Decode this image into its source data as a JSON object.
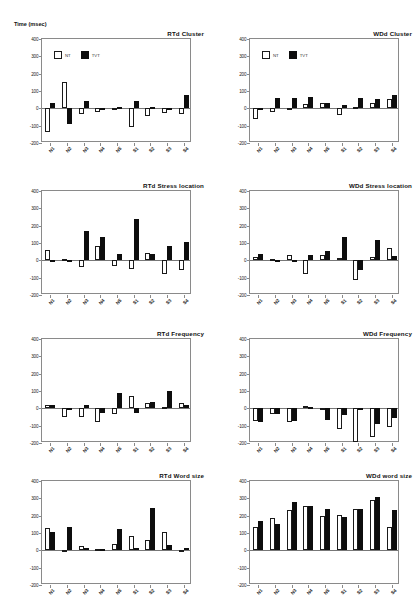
{
  "figure": {
    "width": 417,
    "height": 604,
    "ylabel": "Time (msec)",
    "legend": [
      {
        "key": "open",
        "label": "NT"
      },
      {
        "key": "filled",
        "label": "TVT"
      }
    ]
  },
  "chart_data": [
    {
      "id": "rtd-cluster",
      "type": "bar",
      "title": "RTd Cluster",
      "ylabel": "Time (msec)",
      "xlabel": "",
      "ylim": [
        -200,
        400
      ],
      "yticks": [
        400,
        300,
        200,
        100,
        0,
        -100,
        -200
      ],
      "grid": false,
      "legend_position": "top-left",
      "categories": [
        "N1",
        "N2",
        "N3",
        "N4",
        "N5",
        "S1",
        "S2",
        "S3",
        "S4"
      ],
      "series": [
        {
          "name": "NT",
          "values": [
            -135,
            150,
            -35,
            -20,
            -8,
            -108,
            -42,
            -25,
            -30
          ]
        },
        {
          "name": "TVT",
          "values": [
            28,
            -90,
            45,
            -12,
            10,
            42,
            8,
            -10,
            78
          ]
        }
      ]
    },
    {
      "id": "wdd-cluster",
      "type": "bar",
      "title": "WDd Cluster",
      "ylabel": "Time (msec)",
      "xlabel": "",
      "ylim": [
        -200,
        400
      ],
      "yticks": [
        400,
        300,
        200,
        100,
        0,
        -100,
        -200
      ],
      "grid": false,
      "legend_position": "top-left",
      "categories": [
        "N1",
        "N2",
        "N3",
        "N4",
        "N5",
        "S1",
        "S2",
        "S3",
        "S4"
      ],
      "series": [
        {
          "name": "NT",
          "values": [
            -62,
            -22,
            -8,
            25,
            30,
            -38,
            8,
            30,
            55
          ]
        },
        {
          "name": "TVT",
          "values": [
            -5,
            60,
            62,
            68,
            28,
            22,
            62,
            52,
            78
          ]
        }
      ]
    },
    {
      "id": "rtd-stress-location",
      "type": "bar",
      "title": "RTd Stress location",
      "ylabel": "Time (msec)",
      "xlabel": "",
      "ylim": [
        -200,
        400
      ],
      "yticks": [
        400,
        300,
        200,
        100,
        0,
        -100,
        -200
      ],
      "grid": false,
      "legend_position": "none",
      "categories": [
        "N1",
        "N2",
        "N3",
        "N4",
        "N5",
        "S1",
        "S2",
        "S3",
        "S4"
      ],
      "series": [
        {
          "name": "NT",
          "values": [
            62,
            5,
            -38,
            85,
            -32,
            -48,
            40,
            -78,
            -58
          ]
        },
        {
          "name": "TVT",
          "values": [
            0,
            0,
            168,
            135,
            35,
            238,
            38,
            85,
            108
          ]
        }
      ]
    },
    {
      "id": "wdd-stress-location",
      "type": "bar",
      "title": "WDd Stress location",
      "ylabel": "Time (msec)",
      "xlabel": "",
      "ylim": [
        -200,
        400
      ],
      "yticks": [
        400,
        300,
        200,
        100,
        0,
        -100,
        -200
      ],
      "grid": false,
      "legend_position": "none",
      "categories": [
        "N1",
        "N2",
        "N3",
        "N4",
        "N5",
        "S1",
        "S2",
        "S3",
        "S4"
      ],
      "series": [
        {
          "name": "NT",
          "values": [
            18,
            5,
            30,
            -78,
            28,
            15,
            -115,
            22,
            70
          ]
        },
        {
          "name": "TVT",
          "values": [
            38,
            0,
            -8,
            28,
            52,
            132,
            -55,
            115,
            25
          ]
        }
      ]
    },
    {
      "id": "rtd-frequency",
      "type": "bar",
      "title": "RTd Frequency",
      "ylabel": "Time (msec)",
      "xlabel": "",
      "ylim": [
        -200,
        400
      ],
      "yticks": [
        400,
        300,
        200,
        100,
        0,
        -100,
        -200
      ],
      "grid": false,
      "legend_position": "none",
      "categories": [
        "N1",
        "N2",
        "N3",
        "N4",
        "N5",
        "S1",
        "S2",
        "S3",
        "S4"
      ],
      "series": [
        {
          "name": "NT",
          "values": [
            22,
            -52,
            -48,
            -78,
            -30,
            72,
            32,
            5,
            28
          ]
        },
        {
          "name": "TVT",
          "values": [
            22,
            -12,
            22,
            -28,
            88,
            -28,
            38,
            98,
            18
          ]
        }
      ]
    },
    {
      "id": "wdd-frequency",
      "type": "bar",
      "title": "WDd Frequency",
      "ylabel": "Time (msec)",
      "xlabel": "",
      "ylim": [
        -200,
        400
      ],
      "yticks": [
        400,
        300,
        200,
        100,
        0,
        -100,
        -200
      ],
      "grid": false,
      "legend_position": "none",
      "categories": [
        "N1",
        "N2",
        "N3",
        "N4",
        "N5",
        "S1",
        "S2",
        "S3",
        "S4"
      ],
      "series": [
        {
          "name": "NT",
          "values": [
            -72,
            -30,
            -78,
            15,
            -5,
            -118,
            -195,
            -165,
            -108
          ]
        },
        {
          "name": "TVT",
          "values": [
            -78,
            -32,
            -72,
            8,
            -65,
            -40,
            -8,
            -88,
            -58
          ]
        }
      ]
    },
    {
      "id": "rtd-word-size",
      "type": "bar",
      "title": "RTd Word size",
      "ylabel": "Time (msec)",
      "xlabel": "",
      "ylim": [
        -200,
        400
      ],
      "yticks": [
        400,
        300,
        200,
        100,
        0,
        -100,
        -200
      ],
      "grid": false,
      "legend_position": "none",
      "categories": [
        "N1",
        "N2",
        "N3",
        "N4",
        "N5",
        "S1",
        "S2",
        "S3",
        "S4"
      ],
      "series": [
        {
          "name": "NT",
          "values": [
            128,
            -8,
            25,
            8,
            38,
            82,
            62,
            108,
            2
          ]
        },
        {
          "name": "TVT",
          "values": [
            108,
            135,
            15,
            8,
            122,
            12,
            245,
            28,
            15
          ]
        }
      ]
    },
    {
      "id": "wdd-word-size",
      "type": "bar",
      "title": "WDd word size",
      "ylabel": "Time (msec)",
      "xlabel": "",
      "ylim": [
        -200,
        400
      ],
      "yticks": [
        400,
        300,
        200,
        100,
        0,
        -100,
        -200
      ],
      "grid": false,
      "legend_position": "none",
      "categories": [
        "N1",
        "N2",
        "N3",
        "N4",
        "N5",
        "S1",
        "S2",
        "S3",
        "S4"
      ],
      "series": [
        {
          "name": "NT",
          "values": [
            132,
            188,
            232,
            258,
            200,
            202,
            240,
            292,
            132
          ]
        },
        {
          "name": "TVT",
          "values": [
            172,
            150,
            278,
            258,
            240,
            190,
            238,
            310,
            232
          ]
        }
      ]
    }
  ],
  "panel_layout": [
    {
      "id": "rtd-cluster",
      "left": 8,
      "top": 30
    },
    {
      "id": "wdd-cluster",
      "left": 216,
      "top": 30
    },
    {
      "id": "rtd-stress-location",
      "left": 8,
      "top": 182
    },
    {
      "id": "wdd-stress-location",
      "left": 216,
      "top": 182
    },
    {
      "id": "rtd-frequency",
      "left": 8,
      "top": 330
    },
    {
      "id": "wdd-frequency",
      "left": 216,
      "top": 330
    },
    {
      "id": "rtd-word-size",
      "left": 8,
      "top": 472
    },
    {
      "id": "wdd-word-size",
      "left": 216,
      "top": 472
    }
  ]
}
